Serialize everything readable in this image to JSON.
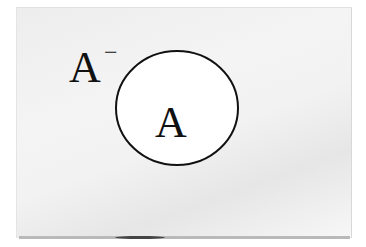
{
  "diagram": {
    "type": "venn",
    "universe": {
      "complement_label": "A",
      "complement_mark": "−"
    },
    "sets": [
      {
        "name": "A",
        "label": "A"
      }
    ],
    "colors": {
      "panel": "#f0f0f0",
      "stroke": "#111111",
      "set_fill": "#ffffff"
    }
  }
}
